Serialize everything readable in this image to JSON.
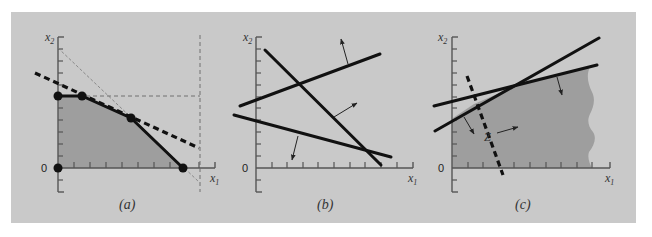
{
  "figure": {
    "background_color": "#c9c9c9",
    "shade_color": "#9e9e9e",
    "line_color": "#111111"
  },
  "panels": [
    {
      "id": "a",
      "caption": "(a)",
      "x_axis_label": "x",
      "x_axis_sub": "1",
      "y_axis_label": "x",
      "y_axis_sub": "2",
      "origin_label": "0",
      "description": "Feasible region bounded by constraints with optimal objective line (dashed) touching a corner point"
    },
    {
      "id": "b",
      "caption": "(b)",
      "x_axis_label": "x",
      "x_axis_sub": "1",
      "y_axis_label": "x",
      "y_axis_sub": "2",
      "origin_label": "0",
      "description": "Three constraint lines with arrows indicating infeasible direction (no feasible region)"
    },
    {
      "id": "c",
      "caption": "(c)",
      "x_axis_label": "x",
      "x_axis_sub": "1",
      "y_axis_label": "x",
      "y_axis_sub": "2",
      "origin_label": "0",
      "objective_label": "Z",
      "description": "Unbounded feasible region with objective line Z and direction arrow"
    }
  ]
}
